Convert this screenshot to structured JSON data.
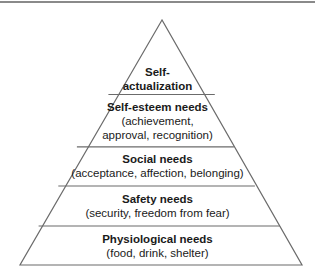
{
  "diagram": {
    "type": "pyramid",
    "tiers": [
      {
        "title": "Self-\nactualization",
        "description": ""
      },
      {
        "title": "Self-esteem needs",
        "description": "(achievement,\napproval, recognition)"
      },
      {
        "title": "Social needs",
        "description": "(acceptance, affection, belonging)"
      },
      {
        "title": "Safety needs",
        "description": "(security, freedom from fear)"
      },
      {
        "title": "Physiological needs",
        "description": "(food, drink, shelter)"
      }
    ],
    "colors": {
      "line": "#6b6b6b",
      "fill": "#ffffff",
      "text": "#1a1a1a"
    }
  }
}
